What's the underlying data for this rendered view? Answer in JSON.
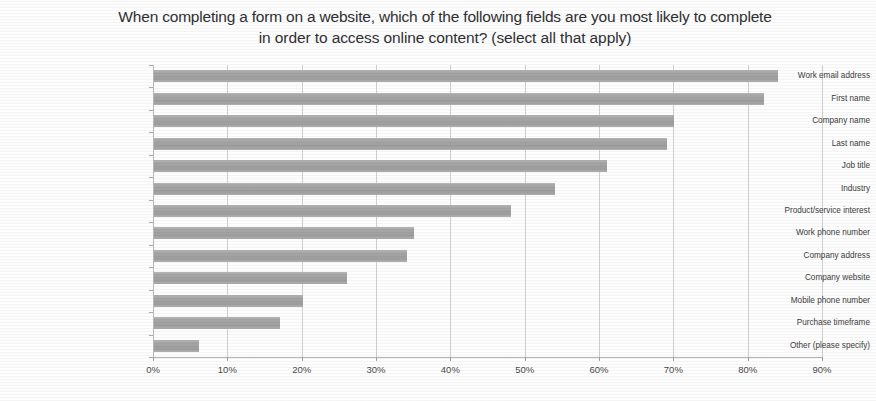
{
  "chart_data": {
    "type": "bar",
    "orientation": "horizontal",
    "title": "When completing a form on a website, which of the following fields are you most likely to complete in order to access online content? (select all that apply)",
    "title_line1": "When completing a form on a website, which of the following fields are you most likely to complete",
    "title_line2": "in order to access online content? (select all that apply)",
    "xlabel": "",
    "ylabel": "",
    "xlim": [
      0,
      90
    ],
    "xtick_labels": [
      "0%",
      "10%",
      "20%",
      "30%",
      "40%",
      "50%",
      "60%",
      "70%",
      "80%",
      "90%"
    ],
    "xtick_values": [
      0,
      10,
      20,
      30,
      40,
      50,
      60,
      70,
      80,
      90
    ],
    "grid": true,
    "grid_axis": "x",
    "legend": false,
    "bar_color": "#a6a6a6",
    "categories": [
      "Work email address",
      "First name",
      "Company name",
      "Last name",
      "Job title",
      "Industry",
      "Product/service interest",
      "Work phone number",
      "Company address",
      "Company website",
      "Mobile phone number",
      "Purchase timeframe",
      "Other (please specify)"
    ],
    "values": [
      84,
      82,
      70,
      69,
      61,
      54,
      48,
      35,
      34,
      26,
      20,
      17,
      6
    ],
    "value_unit": "%"
  }
}
